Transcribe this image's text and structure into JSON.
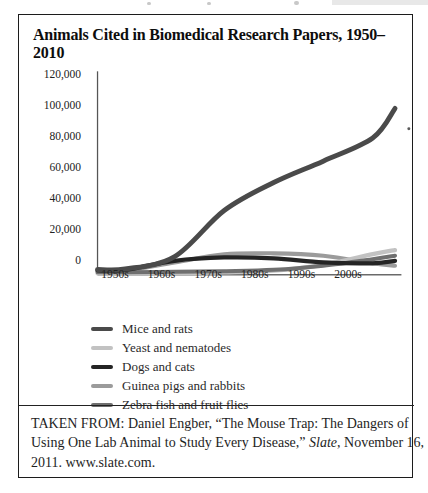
{
  "figure": {
    "title": "Animals Cited in Biomedical Research Papers, 1950–2010",
    "caption_lines": [
      {
        "text": "TAKEN FROM: Daniel Engber, “The Mouse Trap: The Dangers of"
      },
      {
        "pre": "Using One Lab Animal to Study Every Disease,” ",
        "italic": "Slate",
        "post": ", November 16,"
      },
      {
        "text": "2011. www.slate.com."
      }
    ]
  },
  "chart_data": {
    "type": "line",
    "title": "Animals Cited in Biomedical Research Papers, 1950–2010",
    "xlabel": "",
    "ylabel": "",
    "ylim": [
      0,
      120000
    ],
    "grid": false,
    "legend_position": "bottom-left",
    "categories": [
      "1950s",
      "1960s",
      "1970s",
      "1980s",
      "1990s",
      "2000s"
    ],
    "y_ticks": [
      {
        "value": 0,
        "label": "0"
      },
      {
        "value": 20000,
        "label": "20,000"
      },
      {
        "value": 40000,
        "label": "40,000"
      },
      {
        "value": 60000,
        "label": "60,000"
      },
      {
        "value": 80000,
        "label": "80,000"
      },
      {
        "value": 100000,
        "label": "100,000"
      },
      {
        "value": 120000,
        "label": "120,000"
      }
    ],
    "series": [
      {
        "name": "Mice and rats",
        "color": "#4a4a4a",
        "width": 4.6,
        "start_value": 3200,
        "values": [
          3500,
          11000,
          39000,
          56000,
          69000,
          83000
        ],
        "end_value": 101000
      },
      {
        "name": "Yeast and nematodes",
        "color": "#c2c2c2",
        "width": 4.0,
        "start_value": 800,
        "values": [
          900,
          1100,
          1500,
          2500,
          6000,
          12500
        ],
        "end_value": 15000
      },
      {
        "name": "Dogs and cats",
        "color": "#242424",
        "width": 4.0,
        "start_value": 2600,
        "values": [
          3000,
          8500,
          10500,
          10000,
          7500,
          7000
        ],
        "end_value": 8500
      },
      {
        "name": "Guinea pigs and rabbits",
        "color": "#9b9b9b",
        "width": 3.8,
        "start_value": 2200,
        "values": [
          2500,
          7500,
          12500,
          13000,
          11500,
          7000
        ],
        "end_value": 5500
      },
      {
        "name": "Zebra fish and fruit flies",
        "color": "#6f6f6f",
        "width": 3.8,
        "start_value": 1500,
        "values": [
          1600,
          1800,
          2200,
          3000,
          5500,
          9500
        ],
        "end_value": 11600
      }
    ]
  }
}
